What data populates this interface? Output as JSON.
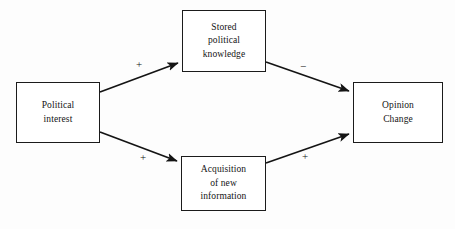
{
  "diagram": {
    "background_color": "#fdfdfd",
    "line_color": "#141414",
    "box_border_color": "#1b1b1b",
    "box_fill_color": "#ffffff",
    "nodes": [
      {
        "id": "political-interest",
        "label": "Political\ninterest",
        "x": 16,
        "y": 82,
        "width": 84,
        "height": 61
      },
      {
        "id": "stored-knowledge",
        "label": "Stored\npolitical\nknowledge",
        "x": 182,
        "y": 10,
        "width": 84,
        "height": 62
      },
      {
        "id": "acquisition",
        "label": "Acquisition\nof new\ninformation",
        "x": 181,
        "y": 156,
        "width": 85,
        "height": 55
      },
      {
        "id": "opinion-change",
        "label": "Opinion\nChange",
        "x": 353,
        "y": 82,
        "width": 90,
        "height": 61
      }
    ],
    "edges": [
      {
        "id": "pi-to-sk",
        "from": "political-interest",
        "to": "stored-knowledge",
        "sign": "+",
        "sign_x": 136,
        "sign_y": 59
      },
      {
        "id": "sk-to-oc",
        "from": "stored-knowledge",
        "to": "opinion-change",
        "sign": "−",
        "sign_x": 300,
        "sign_y": 61
      },
      {
        "id": "pi-to-ac",
        "from": "political-interest",
        "to": "acquisition",
        "sign": "+",
        "sign_x": 140,
        "sign_y": 152
      },
      {
        "id": "ac-to-oc",
        "from": "acquisition",
        "to": "opinion-change",
        "sign": "+",
        "sign_x": 302,
        "sign_y": 151
      }
    ]
  }
}
